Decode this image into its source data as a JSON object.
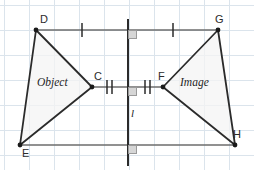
{
  "diagram": {
    "canvas": {
      "width": 254,
      "height": 170
    },
    "colors": {
      "grid_minor": "#d9e2ea",
      "grid_major": "#c3d0db",
      "background": "#ffffff",
      "shape_stroke": "#2b2b2b",
      "shape_fill": "#f2f2f2",
      "connector": "#6b6b6b",
      "mirror_line": "#2b2b2b",
      "right_angle": "#9a9a9a",
      "right_angle_fill": "#d8d8d8",
      "label_text": "#2b2b2b"
    },
    "grid": {
      "spacing": 25,
      "offset_x": 4,
      "offset_y": 5,
      "visible": true
    },
    "vertices": [
      {
        "id": "D",
        "label": "D",
        "x": 36,
        "y": 30,
        "label_dx": 4,
        "label_dy": -16,
        "dot": true
      },
      {
        "id": "C",
        "label": "C",
        "x": 92,
        "y": 87,
        "label_dx": 2,
        "label_dy": -16,
        "dot": true
      },
      {
        "id": "E",
        "label": "E",
        "x": 20,
        "y": 145,
        "label_dx": 2,
        "label_dy": 3,
        "dot": true
      },
      {
        "id": "F",
        "label": "F",
        "x": 163,
        "y": 87,
        "label_dx": -5,
        "label_dy": -16,
        "dot": true
      },
      {
        "id": "G",
        "label": "G",
        "x": 218,
        "y": 30,
        "label_dx": -3,
        "label_dy": -16,
        "dot": true
      },
      {
        "id": "H",
        "label": "H",
        "x": 235,
        "y": 145,
        "label_dx": -2,
        "label_dy": -16,
        "dot": true
      }
    ],
    "object_triangle": {
      "name": "Object",
      "label": "Object",
      "label_x": 40,
      "label_y": 82,
      "points": "36,30 92,87 20,145"
    },
    "image_triangle": {
      "name": "Image",
      "label": "Image",
      "label_x": 180,
      "label_y": 82,
      "points": "218,30 163,87 235,145"
    },
    "mirror_line": {
      "label": "l",
      "label_x": 131,
      "label_y": 112,
      "x": 128,
      "y_top": 19,
      "y_bottom": 166
    },
    "connectors": [
      {
        "id": "D-G",
        "from": "D",
        "to": "G",
        "x1": 36,
        "y1": 30,
        "x2": 218,
        "y2": 30,
        "ticks": 1
      },
      {
        "id": "C-F",
        "from": "C",
        "to": "F",
        "x1": 92,
        "y1": 87,
        "x2": 163,
        "y2": 87,
        "ticks": 2
      },
      {
        "id": "E-H",
        "from": "E",
        "to": "H",
        "x1": 20,
        "y1": 145,
        "x2": 235,
        "y2": 145,
        "ticks": 0
      }
    ],
    "tick_marks": [
      {
        "id": "tick-DG-left",
        "x": 82,
        "y": 30,
        "count": 1
      },
      {
        "id": "tick-DG-right",
        "x": 173,
        "y": 30,
        "count": 1
      },
      {
        "id": "tick-CF-left",
        "x": 110,
        "y": 87,
        "count": 2
      },
      {
        "id": "tick-CF-right",
        "x": 147,
        "y": 87,
        "count": 2
      }
    ],
    "right_angles": [
      {
        "id": "right-angle-top",
        "x": 128,
        "y": 30,
        "size": 8
      },
      {
        "id": "right-angle-middle",
        "x": 128,
        "y": 87,
        "size": 8
      },
      {
        "id": "right-angle-bottom",
        "x": 128,
        "y": 145,
        "size": 8
      }
    ]
  }
}
